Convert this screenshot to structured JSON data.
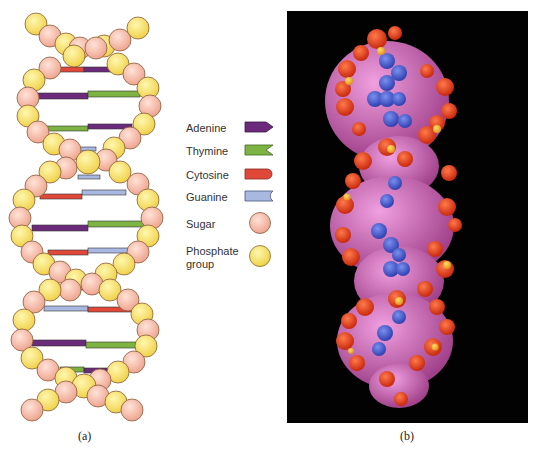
{
  "figure": {
    "panel_a": {
      "caption": "(a)",
      "description": "Schematic double helix DNA model with sugar-phosphate backbones and colored base pairs"
    },
    "panel_b": {
      "caption": "(b)",
      "description": "Space-filling molecular model of DNA on black background"
    },
    "legend": {
      "items": [
        {
          "label": "Adenine",
          "icon": "adenine-pentagon-icon",
          "color": "#6b2a7a"
        },
        {
          "label": "Thymine",
          "icon": "thymine-notch-icon",
          "color": "#7cb342"
        },
        {
          "label": "Cytosine",
          "icon": "cytosine-rounded-icon",
          "color": "#e0483a"
        },
        {
          "label": "Guanine",
          "icon": "guanine-concave-icon",
          "color": "#a9b8e0"
        },
        {
          "label": "Sugar",
          "icon": "sugar-sphere-icon",
          "color": "#f5b8a3"
        },
        {
          "label": "Phosphate group",
          "label_line1": "Phosphate",
          "label_line2": "group",
          "icon": "phosphate-sphere-icon",
          "color": "#f5e060"
        }
      ]
    },
    "colors": {
      "adenine": "#6b2a7a",
      "thymine": "#7cb342",
      "cytosine": "#e0483a",
      "guanine": "#a9b8e0",
      "sugar": "#f5b8a3",
      "phosphate": "#f5e060",
      "background_b": "#020202"
    }
  }
}
